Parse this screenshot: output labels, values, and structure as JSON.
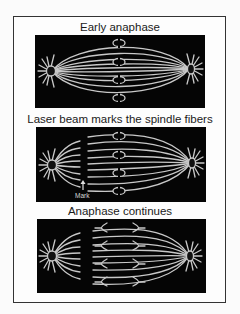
{
  "figure": {
    "stages": [
      {
        "title": "Early anaphase"
      },
      {
        "title": "Laser beam marks the spindle fibers",
        "annotation": {
          "label": "Mark",
          "icon": "up-arrow-icon"
        }
      },
      {
        "title": "Anaphase continues"
      }
    ],
    "colors": {
      "panel_background": "#050505",
      "fiber": "#c8c8c8",
      "frame_border": "#333333",
      "caption_text": "#1a1a1a"
    }
  }
}
